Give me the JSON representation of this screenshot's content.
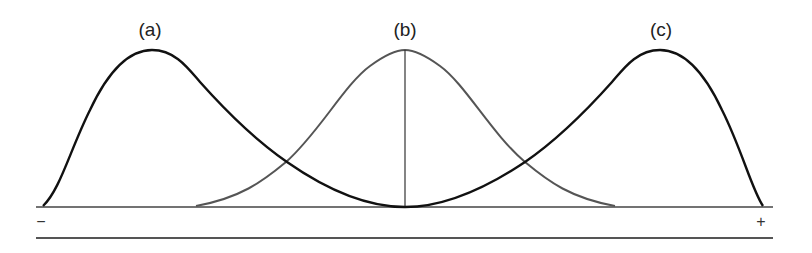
{
  "figure": {
    "curves": [
      {
        "id": "a",
        "label": "(a)",
        "description": "negatively skewed distribution",
        "color": "#111111"
      },
      {
        "id": "b",
        "label": "(b)",
        "description": "symmetric normal distribution",
        "color": "#555555"
      },
      {
        "id": "c",
        "label": "(c)",
        "description": "positively skewed distribution",
        "color": "#111111"
      }
    ],
    "axis": {
      "left_sign": "−",
      "right_sign": "+"
    },
    "colors": {
      "skewed_curves": "#111111",
      "normal_curve": "#555555",
      "axis_lines": "#444444"
    }
  }
}
